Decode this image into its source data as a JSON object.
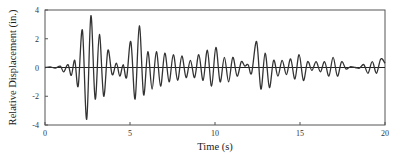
{
  "chart_data": {
    "type": "line",
    "title": "",
    "xlabel": "Time (s)",
    "ylabel": "Relative Displacement (in.)",
    "xlim": [
      0,
      20
    ],
    "ylim": [
      -4,
      4
    ],
    "xticks": [
      0,
      5,
      10,
      15,
      20
    ],
    "yticks": [
      -4,
      -2,
      0,
      2,
      4
    ],
    "grid": false,
    "legend": null,
    "zero_line": true,
    "series": [
      {
        "name": "Relative Displacement",
        "color": "#333333",
        "points": [
          [
            0.0,
            0.0
          ],
          [
            0.3,
            0.05
          ],
          [
            0.6,
            -0.05
          ],
          [
            0.9,
            0.1
          ],
          [
            1.1,
            -0.3
          ],
          [
            1.35,
            0.2
          ],
          [
            1.55,
            -0.55
          ],
          [
            1.75,
            0.5
          ],
          [
            1.95,
            -1.3
          ],
          [
            2.2,
            2.6
          ],
          [
            2.45,
            -3.6
          ],
          [
            2.7,
            3.6
          ],
          [
            2.95,
            -2.2
          ],
          [
            3.2,
            2.3
          ],
          [
            3.45,
            -2.0
          ],
          [
            3.7,
            1.2
          ],
          [
            3.95,
            -0.5
          ],
          [
            4.2,
            0.3
          ],
          [
            4.4,
            -0.6
          ],
          [
            4.6,
            0.2
          ],
          [
            4.8,
            -0.7
          ],
          [
            5.05,
            1.8
          ],
          [
            5.3,
            -2.2
          ],
          [
            5.55,
            2.9
          ],
          [
            5.8,
            -1.9
          ],
          [
            6.05,
            1.1
          ],
          [
            6.3,
            -1.5
          ],
          [
            6.55,
            1.1
          ],
          [
            6.8,
            -1.3
          ],
          [
            7.05,
            1.0
          ],
          [
            7.3,
            -1.0
          ],
          [
            7.55,
            0.9
          ],
          [
            7.8,
            -0.9
          ],
          [
            8.05,
            0.8
          ],
          [
            8.3,
            -0.7
          ],
          [
            8.55,
            0.5
          ],
          [
            8.8,
            -0.7
          ],
          [
            9.05,
            0.9
          ],
          [
            9.3,
            -0.9
          ],
          [
            9.55,
            1.2
          ],
          [
            9.8,
            -1.3
          ],
          [
            10.05,
            1.4
          ],
          [
            10.3,
            -1.0
          ],
          [
            10.55,
            0.7
          ],
          [
            10.8,
            -1.0
          ],
          [
            11.05,
            0.7
          ],
          [
            11.3,
            -0.6
          ],
          [
            11.55,
            0.4
          ],
          [
            11.75,
            0.1
          ],
          [
            11.95,
            0.2
          ],
          [
            12.15,
            -0.4
          ],
          [
            12.45,
            1.8
          ],
          [
            12.7,
            -1.5
          ],
          [
            12.95,
            1.0
          ],
          [
            13.2,
            -1.4
          ],
          [
            13.45,
            0.5
          ],
          [
            13.7,
            -0.6
          ],
          [
            13.95,
            0.5
          ],
          [
            14.2,
            -0.5
          ],
          [
            14.45,
            0.6
          ],
          [
            14.7,
            -0.8
          ],
          [
            14.95,
            0.9
          ],
          [
            15.2,
            -0.9
          ],
          [
            15.45,
            0.4
          ],
          [
            15.7,
            -0.2
          ],
          [
            15.95,
            0.4
          ],
          [
            16.2,
            -0.3
          ],
          [
            16.45,
            0.4
          ],
          [
            16.7,
            -0.6
          ],
          [
            16.95,
            0.7
          ],
          [
            17.2,
            -0.6
          ],
          [
            17.45,
            0.4
          ],
          [
            17.7,
            -0.1
          ],
          [
            17.95,
            0.05
          ],
          [
            18.25,
            0.0
          ],
          [
            18.5,
            -0.05
          ],
          [
            18.75,
            0.2
          ],
          [
            19.0,
            -0.4
          ],
          [
            19.25,
            0.4
          ],
          [
            19.5,
            -0.4
          ],
          [
            19.75,
            0.6
          ],
          [
            20.0,
            0.3
          ]
        ]
      }
    ]
  },
  "axes": {
    "x_label": "Time (s)",
    "y_label": "Relative Displacement (in.)",
    "x_tick_labels": [
      "0",
      "5",
      "10",
      "15",
      "20"
    ],
    "y_tick_labels": [
      "4",
      "2",
      "0",
      "-2",
      "-4"
    ]
  }
}
